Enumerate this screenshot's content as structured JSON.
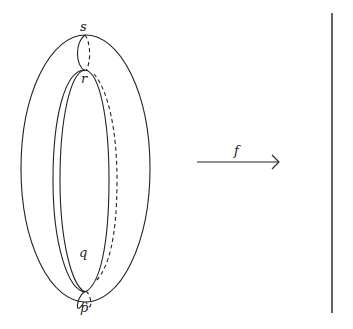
{
  "diagram": {
    "torus": {
      "points": [
        {
          "id": "s",
          "label": "s"
        },
        {
          "id": "r",
          "label": "r"
        },
        {
          "id": "q",
          "label": "q"
        },
        {
          "id": "p",
          "label": "p"
        }
      ]
    },
    "arrow": {
      "label": "f"
    },
    "target": {
      "kind": "vertical-line"
    },
    "colors": {
      "stroke": "#222222",
      "background": "#ffffff"
    }
  }
}
